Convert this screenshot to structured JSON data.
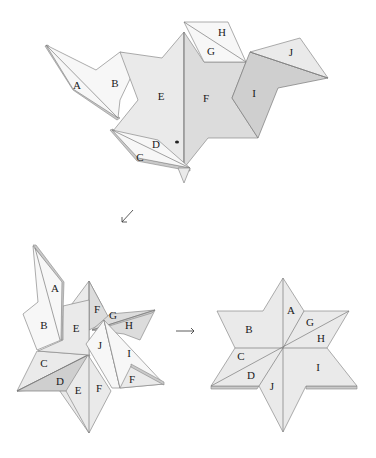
{
  "figure": {
    "steps": [
      {
        "id": "step-1",
        "position": "top",
        "labels": [
          "A",
          "B",
          "C",
          "D",
          "E",
          "F",
          "G",
          "H",
          "I",
          "J"
        ]
      },
      {
        "id": "step-2",
        "position": "bottom-left",
        "labels": [
          "A",
          "B",
          "C",
          "D",
          "E",
          "E",
          "F",
          "F",
          "F",
          "G",
          "H",
          "I",
          "J"
        ]
      },
      {
        "id": "step-3",
        "position": "bottom-right",
        "labels": [
          "A",
          "B",
          "C",
          "D",
          "G",
          "H",
          "I",
          "J"
        ]
      }
    ],
    "arrows": [
      {
        "id": "arrow-diagonal",
        "glyph": "↙",
        "from": "step-1",
        "to": "step-2"
      },
      {
        "id": "arrow-right",
        "glyph": "→",
        "from": "step-2",
        "to": "step-3"
      }
    ]
  },
  "top": {
    "A": "A",
    "B": "B",
    "C": "C",
    "D": "D",
    "E": "E",
    "F": "F",
    "G": "G",
    "H": "H",
    "I": "I",
    "J": "J"
  },
  "left": {
    "A": "A",
    "B": "B",
    "C": "C",
    "D": "D",
    "E1": "E",
    "E2": "E",
    "F1": "F",
    "F2": "F",
    "F3": "F",
    "G": "G",
    "H": "H",
    "I": "I",
    "J": "J"
  },
  "right": {
    "A": "A",
    "B": "B",
    "C": "C",
    "D": "D",
    "G": "G",
    "H": "H",
    "I": "I",
    "J": "J"
  }
}
